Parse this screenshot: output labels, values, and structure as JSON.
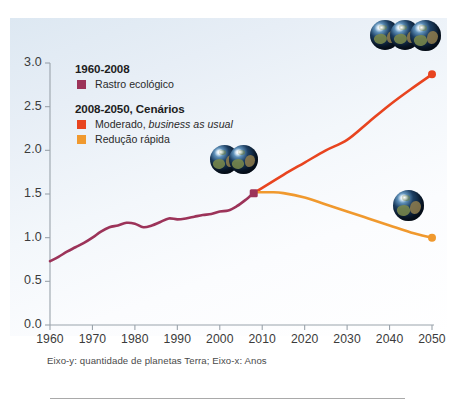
{
  "chart_data": {
    "type": "line",
    "title": "",
    "subtitle": "",
    "caption": "Eixo-y: quantidade de planetas Terra; Eixo-x: Anos",
    "xlabel": "Anos",
    "ylabel": "quantidade de planetas Terra",
    "xlim": [
      1960,
      2050
    ],
    "ylim": [
      0.0,
      3.0
    ],
    "grid": false,
    "legend_position": "upper-left-inside",
    "xticks": [
      "1960",
      "1970",
      "1980",
      "1990",
      "2000",
      "2010",
      "2020",
      "2030",
      "2040",
      "2050"
    ],
    "xtick_values": [
      1960,
      1970,
      1980,
      1990,
      2000,
      2010,
      2020,
      2030,
      2040,
      2050
    ],
    "yticks": [
      "0.0",
      "0.5",
      "1.0",
      "1.5",
      "2.0",
      "2.5",
      "3.0"
    ],
    "ytick_values": [
      0.0,
      0.5,
      1.0,
      1.5,
      2.0,
      2.5,
      3.0
    ],
    "series": [
      {
        "name": "Rastro ecológico",
        "period": "1960-2008",
        "color": "#9c3359",
        "x": [
          1960,
          1962,
          1964,
          1966,
          1968,
          1970,
          1972,
          1974,
          1976,
          1978,
          1980,
          1982,
          1984,
          1986,
          1988,
          1990,
          1992,
          1994,
          1996,
          1998,
          2000,
          2002,
          2004,
          2006,
          2008
        ],
        "values": [
          0.73,
          0.78,
          0.84,
          0.89,
          0.94,
          1.0,
          1.07,
          1.12,
          1.14,
          1.17,
          1.16,
          1.12,
          1.14,
          1.18,
          1.22,
          1.21,
          1.22,
          1.24,
          1.26,
          1.27,
          1.3,
          1.31,
          1.36,
          1.43,
          1.51
        ]
      },
      {
        "name": "Moderado, business as usual",
        "period": "2008-2050",
        "color": "#e8441f",
        "x": [
          2008,
          2015,
          2020,
          2025,
          2030,
          2035,
          2040,
          2045,
          2050
        ],
        "values": [
          1.51,
          1.72,
          1.86,
          2.0,
          2.12,
          2.32,
          2.52,
          2.7,
          2.87
        ]
      },
      {
        "name": "Redução rápida",
        "period": "2008-2050",
        "color": "#f0992e",
        "x": [
          2008,
          2012,
          2015,
          2020,
          2025,
          2030,
          2035,
          2040,
          2045,
          2050
        ],
        "values": [
          1.52,
          1.52,
          1.51,
          1.46,
          1.38,
          1.3,
          1.22,
          1.14,
          1.06,
          1.0
        ]
      }
    ],
    "annotations": [
      {
        "name": "junction-marker",
        "x": 2008,
        "y": 1.51,
        "shape": "square",
        "color": "#9c3359"
      },
      {
        "name": "bau-endpoint",
        "x": 2050,
        "y": 2.87,
        "shape": "circle",
        "color": "#e8441f"
      },
      {
        "name": "reduction-endpoint",
        "x": 2050,
        "y": 1.0,
        "shape": "circle",
        "color": "#f0992e"
      },
      {
        "name": "three-earths-icon",
        "x": 2050,
        "y": 3.1,
        "count": 3,
        "label": "three planets"
      },
      {
        "name": "two-earths-icon",
        "x": 2006,
        "y": 1.8,
        "count": 2,
        "label": "two planets"
      },
      {
        "name": "one-earth-icon",
        "x": 2044,
        "y": 1.2,
        "count": 1,
        "label": "one planet"
      }
    ]
  },
  "legend": {
    "group1": {
      "title": "1960-2008",
      "items": [
        {
          "label": "Rastro ecológico",
          "color": "#9c3359"
        }
      ]
    },
    "group2": {
      "title": "2008-2050, Cenários",
      "items": [
        {
          "label_pre": "Moderado, ",
          "label_em": "business as usual",
          "color": "#e8441f"
        },
        {
          "label_pre": "Redução rápida",
          "label_em": "",
          "color": "#f0992e"
        }
      ]
    }
  },
  "colors": {
    "historical": "#9c3359",
    "business_as_usual": "#e8441f",
    "rapid_reduction": "#f0992e",
    "axis": "#9aa3ab",
    "panel_background": "#e7eef6"
  }
}
